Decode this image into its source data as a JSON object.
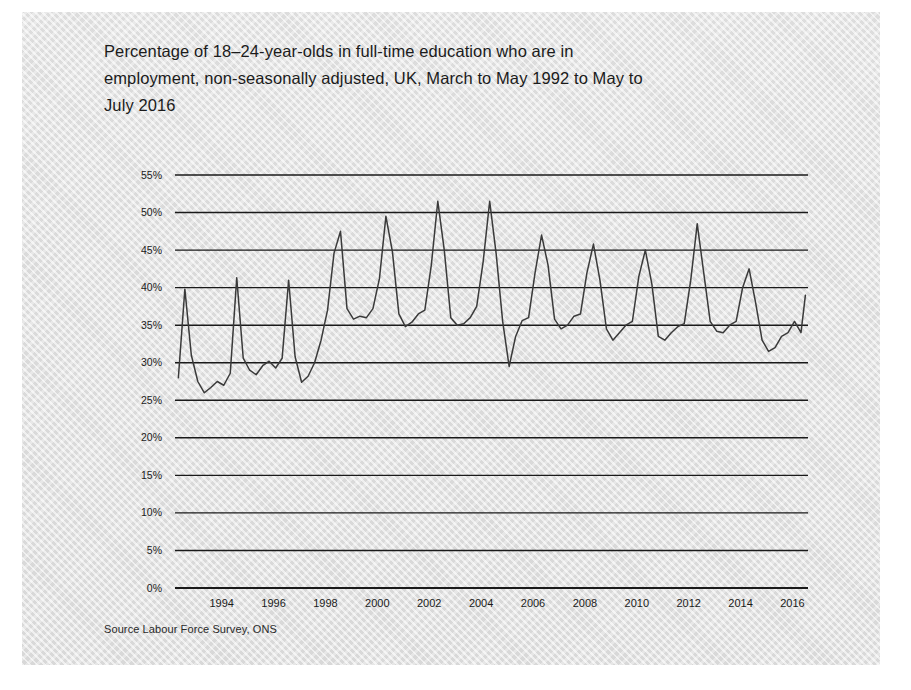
{
  "title": "Percentage of 18–24-year-olds in full-time education who are in employment, non-seasonally adjusted, UK, March to May 1992 to May to July 2016",
  "source": "Source Labour Force Survey, ONS",
  "colors": {
    "panel_background": "#e0e0e0",
    "page_background": "#ffffff",
    "line": "#3a3a3a",
    "gridline": "#1a1a1a",
    "axis": "#111111",
    "text": "#1b1b1b"
  },
  "chart_data": {
    "type": "line",
    "title": "Percentage of 18–24-year-olds in full-time education who are in employment, non-seasonally adjusted, UK, March to May 1992 to May to July 2016",
    "subtitle": "",
    "xlabel": "",
    "ylabel": "",
    "source": "Source Labour Force Survey, ONS",
    "grid": true,
    "legend": "none",
    "xlim": [
      1992.2,
      2016.6
    ],
    "ylim": [
      0,
      55
    ],
    "ytick_labels": [
      "0%",
      "5%",
      "10%",
      "15%",
      "20%",
      "25%",
      "30%",
      "35%",
      "40%",
      "45%",
      "50%",
      "55%"
    ],
    "ytick_values": [
      0,
      5,
      10,
      15,
      20,
      25,
      30,
      35,
      40,
      45,
      50,
      55
    ],
    "xtick_labels": [
      "1994",
      "1996",
      "1998",
      "2000",
      "2002",
      "2004",
      "2006",
      "2008",
      "2010",
      "2012",
      "2014",
      "2016"
    ],
    "xtick_values": [
      1994,
      1996,
      1998,
      2000,
      2002,
      2004,
      2006,
      2008,
      2010,
      2012,
      2014,
      2016
    ],
    "series": [
      {
        "name": "18-24-year-olds in full-time education in employment",
        "unit": "%",
        "x": [
          1992.33,
          1992.58,
          1992.83,
          1993.08,
          1993.33,
          1993.58,
          1993.83,
          1994.08,
          1994.33,
          1994.58,
          1994.83,
          1995.08,
          1995.33,
          1995.58,
          1995.83,
          1996.08,
          1996.33,
          1996.58,
          1996.83,
          1997.08,
          1997.33,
          1997.58,
          1997.83,
          1998.08,
          1998.33,
          1998.58,
          1998.83,
          1999.08,
          1999.33,
          1999.58,
          1999.83,
          2000.08,
          2000.33,
          2000.58,
          2000.83,
          2001.08,
          2001.33,
          2001.58,
          2001.83,
          2002.08,
          2002.33,
          2002.58,
          2002.83,
          2003.08,
          2003.33,
          2003.58,
          2003.83,
          2004.08,
          2004.33,
          2004.58,
          2004.83,
          2005.08,
          2005.33,
          2005.58,
          2005.83,
          2006.08,
          2006.33,
          2006.58,
          2006.83,
          2007.08,
          2007.33,
          2007.58,
          2007.83,
          2008.08,
          2008.33,
          2008.58,
          2008.83,
          2009.08,
          2009.33,
          2009.58,
          2009.83,
          2010.08,
          2010.33,
          2010.58,
          2010.83,
          2011.08,
          2011.33,
          2011.58,
          2011.83,
          2012.08,
          2012.33,
          2012.58,
          2012.83,
          2013.08,
          2013.33,
          2013.58,
          2013.83,
          2014.08,
          2014.33,
          2014.58,
          2014.83,
          2015.08,
          2015.33,
          2015.58,
          2015.83,
          2016.08,
          2016.33,
          2016.5
        ],
        "y": [
          28.0,
          39.8,
          31.0,
          27.5,
          26.0,
          26.7,
          27.5,
          27.0,
          28.6,
          41.3,
          30.6,
          29.0,
          28.4,
          29.6,
          30.2,
          29.3,
          30.6,
          41.0,
          30.8,
          27.4,
          28.2,
          30.0,
          33.0,
          37.0,
          44.6,
          47.5,
          37.2,
          35.8,
          36.2,
          36.0,
          37.2,
          41.2,
          49.5,
          44.8,
          36.5,
          34.8,
          35.4,
          36.5,
          37.0,
          43.0,
          51.5,
          45.0,
          36.0,
          35.0,
          35.2,
          36.0,
          37.5,
          43.5,
          51.5,
          44.5,
          35.5,
          29.5,
          33.5,
          35.6,
          36.0,
          42.0,
          47.0,
          43.0,
          35.8,
          34.5,
          35.0,
          36.2,
          36.5,
          42.0,
          45.8,
          41.0,
          34.5,
          33.0,
          34.0,
          35.0,
          35.5,
          41.5,
          45.0,
          40.5,
          33.5,
          33.0,
          34.0,
          34.8,
          35.2,
          41.0,
          48.5,
          42.0,
          35.5,
          34.2,
          34.0,
          35.0,
          35.5,
          40.0,
          42.5,
          38.0,
          33.0,
          31.5,
          32.0,
          33.5,
          34.0,
          35.5,
          34.0,
          39.0
        ]
      }
    ]
  }
}
